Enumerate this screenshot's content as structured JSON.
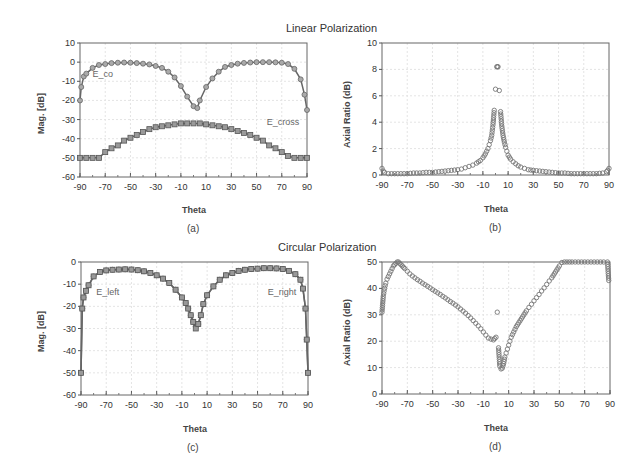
{
  "titles": {
    "linear": "Linear Polarization",
    "circular": "Circular Polarization"
  },
  "chart_data": [
    {
      "id": "a",
      "type": "line",
      "caption": "(a)",
      "title": "",
      "xlabel": "Theta",
      "ylabel": "Mag. [dB]",
      "xlim": [
        -90,
        90
      ],
      "ylim": [
        -60,
        10
      ],
      "xticks": [
        -90,
        -70,
        -50,
        -30,
        -10,
        10,
        30,
        50,
        70,
        90
      ],
      "yticks": [
        10,
        0,
        -10,
        -20,
        -30,
        -40,
        -50,
        -60
      ],
      "grid": true,
      "frame": [
        80,
        43,
        307,
        177
      ],
      "series": [
        {
          "name": "E_co",
          "marker": "circle",
          "label_pos": [
            -80,
            -8
          ],
          "x": [
            -90,
            -89,
            -87,
            -85,
            -80,
            -75,
            -70,
            -65,
            -60,
            -55,
            -50,
            -45,
            -40,
            -35,
            -30,
            -25,
            -20,
            -15,
            -10,
            -5,
            0,
            3,
            5,
            10,
            15,
            20,
            25,
            30,
            35,
            40,
            45,
            50,
            55,
            60,
            65,
            70,
            75,
            80,
            85,
            88,
            90
          ],
          "values": [
            -20,
            -13,
            -7.5,
            -6,
            -3,
            -1.5,
            -1,
            -0.5,
            -0.3,
            -0.2,
            -0.3,
            -0.5,
            -0.8,
            -1.2,
            -2,
            -3,
            -5,
            -8,
            -12.5,
            -18,
            -23,
            -24,
            -20,
            -13,
            -8.5,
            -5,
            -2.5,
            -1.5,
            -0.8,
            -0.4,
            -0.2,
            0,
            0,
            0,
            -0.1,
            -0.3,
            -1,
            -3.5,
            -9,
            -17,
            -25
          ]
        },
        {
          "name": "E_cross",
          "marker": "square",
          "label_pos": [
            58,
            -33
          ],
          "x": [
            -90,
            -85,
            -80,
            -75,
            -70,
            -65,
            -60,
            -55,
            -50,
            -45,
            -40,
            -35,
            -30,
            -25,
            -20,
            -15,
            -10,
            -5,
            0,
            5,
            10,
            15,
            20,
            25,
            30,
            35,
            40,
            45,
            50,
            55,
            60,
            65,
            70,
            75,
            80,
            85,
            90
          ],
          "values": [
            -50,
            -50,
            -50,
            -50,
            -47,
            -45,
            -43.5,
            -41,
            -39.5,
            -38,
            -36.5,
            -35,
            -34,
            -33.5,
            -33,
            -32.5,
            -32,
            -32,
            -32,
            -32,
            -32.5,
            -33,
            -33.5,
            -34,
            -35,
            -36,
            -37,
            -38,
            -39.5,
            -41,
            -43.5,
            -45,
            -47,
            -49,
            -50,
            -50,
            -50
          ]
        }
      ]
    },
    {
      "id": "b",
      "type": "scatter",
      "caption": "(b)",
      "title": "",
      "xlabel": "Theta",
      "ylabel": "Axial Ratio (dB)",
      "xlim": [
        -90,
        90
      ],
      "ylim": [
        0,
        10
      ],
      "xticks": [
        -90,
        -70,
        -50,
        -30,
        -10,
        10,
        30,
        50,
        70,
        90
      ],
      "yticks": [
        10,
        8,
        6,
        4,
        2,
        0
      ],
      "grid": true,
      "frame": [
        382,
        43,
        609,
        175
      ],
      "series": [
        {
          "name": "Axial Ratio",
          "marker": "circle-open",
          "x": [
            -90,
            -89,
            -88,
            -85,
            -80,
            -75,
            -70,
            -65,
            -60,
            -55,
            -50,
            -45,
            -40,
            -35,
            -30,
            -27,
            -24,
            -21,
            -18,
            -15,
            -12,
            -10,
            -8,
            -6,
            -5,
            -4,
            -3,
            -2,
            -1,
            0,
            1,
            1.5,
            2,
            3,
            4,
            5,
            6,
            7,
            8,
            9,
            10,
            12,
            14,
            16,
            18,
            20,
            23,
            26,
            30,
            35,
            40,
            45,
            50,
            55,
            60,
            65,
            70,
            75,
            80,
            85,
            88,
            89,
            90
          ],
          "values": [
            0.5,
            0.3,
            0.2,
            0.1,
            0.1,
            0.1,
            0.1,
            0.15,
            0.15,
            0.2,
            0.2,
            0.25,
            0.3,
            0.35,
            0.4,
            0.45,
            0.55,
            0.65,
            0.75,
            0.9,
            1.1,
            1.3,
            1.6,
            2.0,
            2.3,
            2.6,
            3.0,
            3.8,
            4.9,
            6.5,
            8.2,
            8.2,
            8.2,
            6.4,
            4.8,
            3.7,
            3.0,
            2.5,
            2.1,
            1.8,
            1.5,
            1.2,
            1.0,
            0.85,
            0.7,
            0.6,
            0.5,
            0.4,
            0.35,
            0.3,
            0.25,
            0.2,
            0.15,
            0.15,
            0.1,
            0.1,
            0.1,
            0.1,
            0.1,
            0.15,
            0.25,
            0.35,
            0.5
          ]
        }
      ]
    },
    {
      "id": "c",
      "type": "line",
      "caption": "(c)",
      "title": "",
      "xlabel": "Theta",
      "ylabel": "Mag. [dB]",
      "xlim": [
        -90,
        90
      ],
      "ylim": [
        -60,
        0
      ],
      "xticks": [
        -90,
        -70,
        -50,
        -30,
        -10,
        10,
        30,
        50,
        70,
        90
      ],
      "yticks": [
        0,
        -10,
        -20,
        -30,
        -40,
        -50,
        -60
      ],
      "grid": true,
      "frame": [
        81,
        262,
        308,
        395
      ],
      "series": [
        {
          "name": "E_left",
          "marker": "circle",
          "label_pos": [
            -78,
            -15
          ],
          "x": [
            -90,
            -89,
            -88,
            -86,
            -84,
            -80,
            -75,
            -70,
            -65,
            -60,
            -55,
            -50,
            -45,
            -40,
            -35,
            -30,
            -25,
            -20,
            -15,
            -10,
            -7,
            -5,
            -3,
            -1,
            1,
            3,
            5,
            7,
            10,
            15,
            20,
            25,
            30,
            35,
            40,
            45,
            50,
            55,
            60,
            65,
            70,
            75,
            80,
            84,
            86,
            88,
            89,
            90
          ],
          "values": [
            -50,
            -21,
            -16,
            -13,
            -10.5,
            -6.5,
            -4.5,
            -3.8,
            -3.5,
            -3.4,
            -3.3,
            -3.4,
            -3.7,
            -4.2,
            -5,
            -6,
            -7.5,
            -9.5,
            -12.5,
            -16,
            -18.5,
            -21,
            -24,
            -27,
            -29,
            -28,
            -24,
            -19,
            -15,
            -11,
            -8,
            -6,
            -5,
            -4,
            -3.5,
            -3.2,
            -3,
            -2.8,
            -2.8,
            -2.9,
            -3.2,
            -4,
            -5.5,
            -8,
            -12,
            -21,
            -35,
            -50
          ]
        },
        {
          "name": "E_right",
          "marker": "square",
          "label_pos": [
            58,
            -15
          ],
          "x": [
            -90,
            -89,
            -88,
            -86,
            -84,
            -80,
            -75,
            -70,
            -65,
            -60,
            -55,
            -50,
            -45,
            -40,
            -35,
            -30,
            -25,
            -20,
            -15,
            -10,
            -7,
            -5,
            -3,
            -1,
            1,
            3,
            5,
            7,
            10,
            15,
            20,
            25,
            30,
            35,
            40,
            45,
            50,
            55,
            60,
            65,
            70,
            75,
            80,
            84,
            86,
            88,
            89,
            90
          ],
          "values": [
            -50,
            -21,
            -16,
            -13,
            -10.5,
            -6.5,
            -4.5,
            -3.8,
            -3.5,
            -3.4,
            -3.3,
            -3.4,
            -3.7,
            -4.2,
            -5,
            -6,
            -7.5,
            -9.5,
            -12.5,
            -16,
            -18.5,
            -21,
            -24,
            -27,
            -30,
            -28,
            -24,
            -19,
            -15,
            -11,
            -8,
            -6,
            -5,
            -4,
            -3.5,
            -3.2,
            -3,
            -2.8,
            -2.8,
            -2.9,
            -3.2,
            -4,
            -5.5,
            -8,
            -12,
            -21,
            -35,
            -50
          ]
        }
      ]
    },
    {
      "id": "d",
      "type": "scatter",
      "caption": "(d)",
      "title": "",
      "xlabel": "Theta",
      "ylabel": "Axial Ratio (dB)",
      "xlim": [
        -90,
        90
      ],
      "ylim": [
        0,
        50
      ],
      "xticks": [
        -90,
        -70,
        -50,
        -30,
        -10,
        10,
        30,
        50,
        70,
        90
      ],
      "yticks": [
        50,
        40,
        30,
        20,
        10,
        0
      ],
      "grid": true,
      "frame": [
        382,
        262,
        610,
        394
      ],
      "series": [
        {
          "name": "Axial Ratio",
          "marker": "circle-open",
          "x": [
            -90,
            -89,
            -88,
            -87,
            -86,
            -85,
            -84,
            -83,
            -82,
            -81,
            -80,
            -79,
            -78,
            -77,
            -76,
            -75,
            -74,
            -73,
            -72,
            -70,
            -68,
            -66,
            -64,
            -62,
            -60,
            -58,
            -56,
            -54,
            -52,
            -50,
            -48,
            -46,
            -44,
            -42,
            -40,
            -38,
            -36,
            -34,
            -32,
            -30,
            -28,
            -26,
            -24,
            -22,
            -20,
            -18,
            -16,
            -14,
            -12,
            -10,
            -8,
            -6,
            -4,
            -2,
            -1,
            0,
            1,
            2,
            3,
            4,
            5,
            6,
            7,
            8,
            9,
            10,
            11,
            12,
            13,
            14,
            15,
            16,
            18,
            20,
            22,
            24,
            26,
            28,
            30,
            32,
            34,
            36,
            38,
            40,
            42,
            44,
            46,
            48,
            50,
            52,
            54,
            56,
            60,
            65,
            70,
            75,
            80,
            85,
            88,
            89
          ],
          "values": [
            31,
            37,
            40,
            42,
            43.5,
            44.5,
            45.5,
            46.5,
            47.5,
            48.5,
            49,
            49.5,
            50,
            50,
            49.5,
            49,
            48.5,
            48,
            47.5,
            46.5,
            45.5,
            44.7,
            44,
            43.3,
            42.7,
            42,
            41.4,
            40.8,
            40.2,
            39.5,
            38.9,
            38.3,
            37.7,
            37,
            36.4,
            35.7,
            35,
            34.4,
            33.7,
            33,
            32.2,
            31.4,
            30.6,
            29.7,
            28.8,
            27.8,
            26.8,
            25.8,
            24.7,
            23.5,
            22.3,
            21.2,
            20.8,
            20.5,
            21,
            21.5,
            31,
            17.5,
            10.5,
            9.5,
            9.8,
            11.5,
            14,
            15.5,
            17,
            18.5,
            20,
            21.5,
            22.5,
            23.5,
            24.5,
            25.5,
            27,
            28.5,
            30,
            31.5,
            32.8,
            34,
            35.3,
            36.5,
            37.7,
            39,
            40.2,
            41.5,
            42.8,
            44,
            45.5,
            47,
            48.5,
            49.8,
            50,
            50,
            50,
            50,
            50,
            50,
            50,
            50,
            50,
            43
          ]
        }
      ]
    }
  ]
}
